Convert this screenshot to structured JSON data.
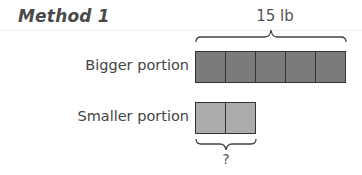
{
  "title": "Method 1",
  "total_label": "15 lb",
  "rows": [
    {
      "label": "Bigger portion",
      "units": 5,
      "color": "#7b7b7b"
    },
    {
      "label": "Smaller portion",
      "units": 2,
      "color": "#acacac"
    }
  ],
  "unknown_label": "?"
}
